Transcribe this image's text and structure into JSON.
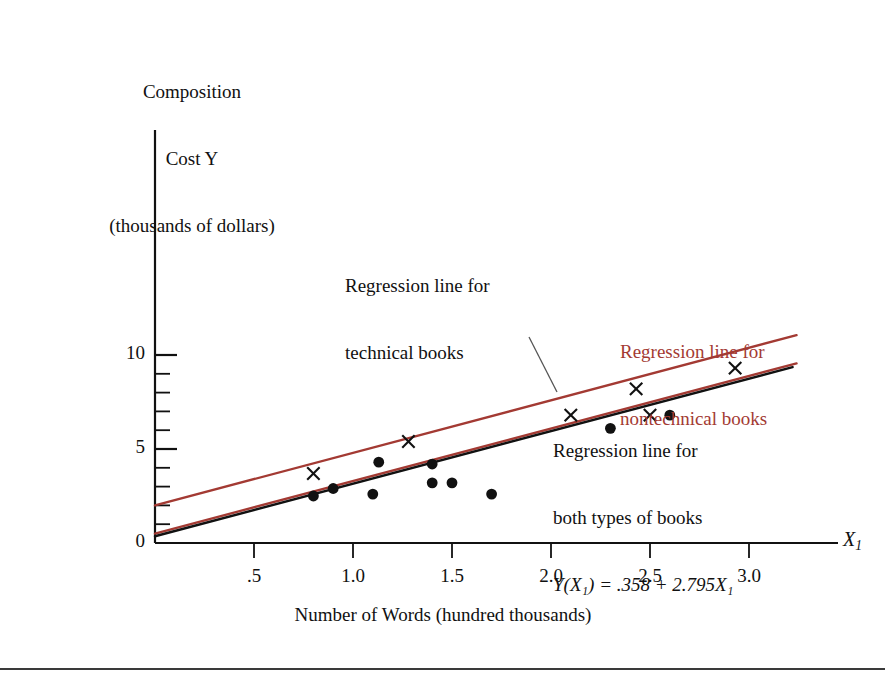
{
  "figure": {
    "y_axis_title_lines": [
      "Composition",
      "Cost Y",
      "(thousands of dollars)"
    ],
    "x_axis_title": "Number of Words (hundred thousands)",
    "x_axis_symbol": "X",
    "x_axis_symbol_sub": "1"
  },
  "annotations": {
    "technical": {
      "line1": "Regression line for",
      "line2": "technical books",
      "color": "#111111"
    },
    "nontechnical": {
      "line1": "Regression line for",
      "line2": "nontechnical books",
      "color": "#a33a33"
    },
    "both": {
      "line1": "Regression line for",
      "line2": "both types of books",
      "equation": "Y(X₁) = .358 + 2.795X₁",
      "equation_lhs": "Y",
      "equation_hat": "ˆ",
      "color": "#111111"
    }
  },
  "chart_data": {
    "type": "scatter",
    "title": "",
    "xlabel": "Number of Words (hundred thousands)",
    "ylabel": "Composition Cost Y (thousands of dollars)",
    "xlim": [
      0,
      3.35
    ],
    "ylim": [
      0,
      10.6
    ],
    "grid": false,
    "legend": "none",
    "x_ticks": [
      0.5,
      1.0,
      1.5,
      2.0,
      2.5,
      3.0
    ],
    "x_tick_labels": [
      ".5",
      "1.0",
      "1.5",
      "2.0",
      "2.5",
      "3.0"
    ],
    "y_ticks": [
      0,
      1,
      2,
      3,
      4,
      5,
      6,
      7,
      8,
      9,
      10
    ],
    "y_tick_labels_shown": [
      "0",
      "5",
      "10"
    ],
    "series": [
      {
        "name": "technical books",
        "marker": "x",
        "color": "#111111",
        "points": [
          {
            "x": 0.8,
            "y": 3.7
          },
          {
            "x": 1.28,
            "y": 5.4
          },
          {
            "x": 2.1,
            "y": 6.8
          },
          {
            "x": 2.43,
            "y": 8.2
          },
          {
            "x": 2.5,
            "y": 6.8
          },
          {
            "x": 2.93,
            "y": 9.3
          }
        ]
      },
      {
        "name": "nontechnical books",
        "marker": "dot",
        "color": "#111111",
        "points": [
          {
            "x": 0.8,
            "y": 2.5
          },
          {
            "x": 0.9,
            "y": 2.9
          },
          {
            "x": 1.1,
            "y": 2.6
          },
          {
            "x": 1.13,
            "y": 4.3
          },
          {
            "x": 1.4,
            "y": 4.2
          },
          {
            "x": 1.4,
            "y": 3.2
          },
          {
            "x": 1.5,
            "y": 3.2
          },
          {
            "x": 1.7,
            "y": 2.6
          },
          {
            "x": 2.3,
            "y": 6.1
          },
          {
            "x": 2.6,
            "y": 6.8
          }
        ]
      }
    ],
    "lines": [
      {
        "name": "regression line for technical books",
        "color": "#a33a33",
        "intercept": 2.0,
        "slope": 2.795,
        "x_start": 0.0,
        "x_end": 3.24
      },
      {
        "name": "regression line for nontechnical books",
        "color": "#a33a33",
        "intercept": 0.5,
        "slope": 2.795,
        "x_start": 0.0,
        "x_end": 3.24
      },
      {
        "name": "regression line for both types of books",
        "color": "#111111",
        "intercept": 0.358,
        "slope": 2.795,
        "x_start": 0.0,
        "x_end": 3.22
      }
    ]
  }
}
